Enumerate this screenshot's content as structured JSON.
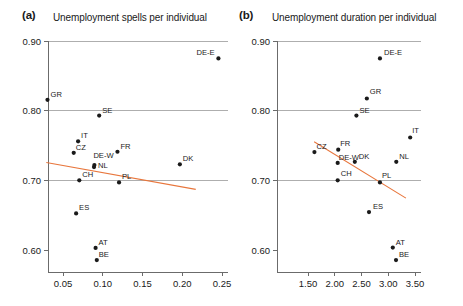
{
  "figure": {
    "background": "#ffffff",
    "marker_color": "#1a1a1a",
    "fit_line_color": "#e8763c",
    "grid_color": "#9a9a9a",
    "axis_color": "#6b6b6b"
  },
  "panels": {
    "a": {
      "letter": "(a)",
      "title": "Unemployment spells per individual"
    },
    "b": {
      "letter": "(b)",
      "title": "Unemployment duration per individual"
    }
  },
  "chart_data": [
    {
      "type": "scatter",
      "panel": "a",
      "title": "Unemployment spells per individual",
      "xlabel": "",
      "ylabel": "",
      "xlim": [
        0.025,
        0.265
      ],
      "ylim": [
        0.575,
        0.905
      ],
      "xticks": [
        0.05,
        0.1,
        0.15,
        0.2,
        0.25
      ],
      "xtick_labels": [
        "0.05",
        "0.10",
        "0.15",
        "0.20",
        "0.25"
      ],
      "yticks": [
        0.6,
        0.7,
        0.8,
        0.9
      ],
      "ytick_labels": [
        "0.60",
        "0.70",
        "0.80",
        "0.90"
      ],
      "grid": "horizontal-at-0.70-0.80-0.90",
      "legend": "none",
      "points": [
        {
          "label": "DE-E",
          "x": 0.2455,
          "y": 0.875,
          "label_dx": -22,
          "label_dy": -3
        },
        {
          "label": "GR",
          "x": 0.0305,
          "y": 0.8155,
          "label_dx": 3,
          "label_dy": -3
        },
        {
          "label": "SE",
          "x": 0.0955,
          "y": 0.793,
          "label_dx": 3,
          "label_dy": -3
        },
        {
          "label": "IT",
          "x": 0.069,
          "y": 0.756,
          "label_dx": 3,
          "label_dy": -3
        },
        {
          "label": "CZ",
          "x": 0.0635,
          "y": 0.7395,
          "label_dx": 2,
          "label_dy": -3
        },
        {
          "label": "FR",
          "x": 0.1185,
          "y": 0.741,
          "label_dx": 3,
          "label_dy": -3
        },
        {
          "label": "DK",
          "x": 0.197,
          "y": 0.723,
          "label_dx": 3,
          "label_dy": -3
        },
        {
          "label": "DE-W",
          "x": 0.0895,
          "y": 0.722,
          "label_dx": -1,
          "label_dy": -7
        },
        {
          "label": "NL",
          "x": 0.089,
          "y": 0.719,
          "label_dx": 4,
          "label_dy": 1
        },
        {
          "label": "CH",
          "x": 0.0705,
          "y": 0.7,
          "label_dx": 3,
          "label_dy": -3
        },
        {
          "label": "PL",
          "x": 0.1205,
          "y": 0.697,
          "label_dx": 3,
          "label_dy": -3
        },
        {
          "label": "ES",
          "x": 0.0665,
          "y": 0.6525,
          "label_dx": 3,
          "label_dy": -3
        },
        {
          "label": "AT",
          "x": 0.091,
          "y": 0.603,
          "label_dx": 3,
          "label_dy": -3
        },
        {
          "label": "BE",
          "x": 0.0925,
          "y": 0.5855,
          "label_dx": 2,
          "label_dy": -3
        }
      ],
      "fit_line": {
        "x0": 0.029,
        "y0": 0.7255,
        "x1": 0.217,
        "y1": 0.687
      }
    },
    {
      "type": "scatter",
      "panel": "b",
      "title": "Unemployment duration per individual",
      "xlabel": "",
      "ylabel": "",
      "xlim": [
        1.35,
        3.6
      ],
      "ylim": [
        0.575,
        0.905
      ],
      "xticks": [
        1.5,
        2.0,
        2.5,
        3.0,
        3.5
      ],
      "xtick_labels": [
        "1.50",
        "2.00",
        "2.50",
        "3.00",
        "3.50"
      ],
      "yticks": [
        0.6,
        0.7,
        0.8,
        0.9
      ],
      "ytick_labels": [
        "0.60",
        "0.70",
        "0.80",
        "0.90"
      ],
      "grid": "horizontal-at-0.70-0.80-0.90",
      "legend": "none",
      "points": [
        {
          "label": "DE-E",
          "x": 2.845,
          "y": 0.875,
          "label_dx": 4,
          "label_dy": -3
        },
        {
          "label": "GR",
          "x": 2.6,
          "y": 0.8175,
          "label_dx": 3,
          "label_dy": -4
        },
        {
          "label": "SE",
          "x": 2.405,
          "y": 0.793,
          "label_dx": 3,
          "label_dy": -3
        },
        {
          "label": "IT",
          "x": 3.41,
          "y": 0.7615,
          "label_dx": 2,
          "label_dy": -4
        },
        {
          "label": "CZ",
          "x": 1.62,
          "y": 0.7405,
          "label_dx": 2,
          "label_dy": -3
        },
        {
          "label": "FR",
          "x": 2.065,
          "y": 0.744,
          "label_dx": 2,
          "label_dy": -4
        },
        {
          "label": "DE-W",
          "x": 2.055,
          "y": 0.725,
          "label_dx": 1,
          "label_dy": -3
        },
        {
          "label": "DK",
          "x": 2.375,
          "y": 0.7265,
          "label_dx": 4,
          "label_dy": 0
        },
        {
          "label": "NL",
          "x": 3.15,
          "y": 0.7265,
          "label_dx": 3,
          "label_dy": -3
        },
        {
          "label": "CH",
          "x": 2.055,
          "y": 0.7,
          "label_dx": 3,
          "label_dy": -4
        },
        {
          "label": "PL",
          "x": 2.845,
          "y": 0.697,
          "label_dx": 2,
          "label_dy": -4
        },
        {
          "label": "ES",
          "x": 2.64,
          "y": 0.6545,
          "label_dx": 4,
          "label_dy": -3
        },
        {
          "label": "AT",
          "x": 3.085,
          "y": 0.6035,
          "label_dx": 3,
          "label_dy": -3
        },
        {
          "label": "BE",
          "x": 3.145,
          "y": 0.5855,
          "label_dx": 3,
          "label_dy": -3
        }
      ],
      "fit_line": {
        "x0": 1.615,
        "y0": 0.7555,
        "x1": 3.33,
        "y1": 0.6745
      }
    }
  ]
}
